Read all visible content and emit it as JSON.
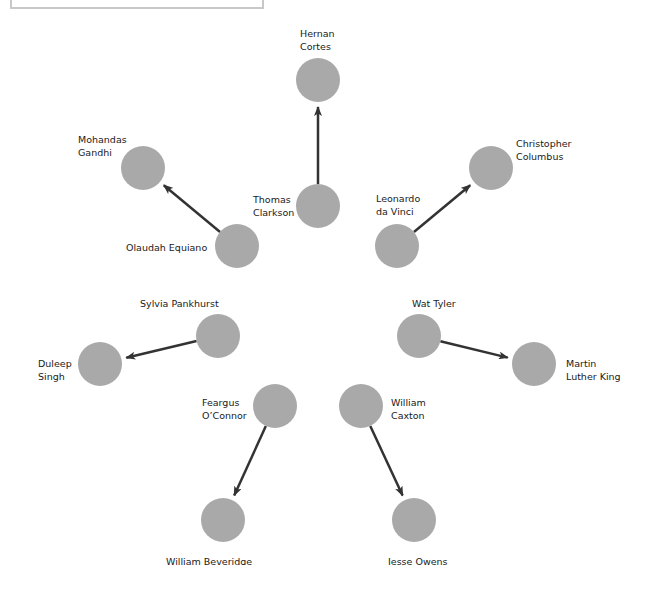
{
  "diagram": {
    "node_color": "#a9a9a9",
    "arrow_color": "#333333",
    "nodes": [
      {
        "id": "cortes",
        "label": "Hernan\nCortes",
        "cx": 318,
        "cy": 80,
        "lx": 300,
        "ly": 27
      },
      {
        "id": "clarkson",
        "label": "Thomas\nClarkson",
        "cx": 318,
        "cy": 206,
        "lx": 253,
        "ly": 193
      },
      {
        "id": "gandhi",
        "label": "Mohandas\nGandhi",
        "cx": 143,
        "cy": 168,
        "lx": 78,
        "ly": 133
      },
      {
        "id": "equiano",
        "label": "Olaudah Equiano",
        "cx": 237,
        "cy": 246,
        "lx": 126,
        "ly": 241
      },
      {
        "id": "columbus",
        "label": "Christopher\nColumbus",
        "cx": 491,
        "cy": 168,
        "lx": 516,
        "ly": 137
      },
      {
        "id": "davinci",
        "label": "Leonardo\nda Vinci",
        "cx": 397,
        "cy": 246,
        "lx": 376,
        "ly": 192
      },
      {
        "id": "pankhurst",
        "label": "Sylvia Pankhurst",
        "cx": 218,
        "cy": 336,
        "lx": 140,
        "ly": 297
      },
      {
        "id": "singh",
        "label": "Duleep\nSingh",
        "cx": 100,
        "cy": 364,
        "lx": 38,
        "ly": 357
      },
      {
        "id": "tyler",
        "label": "Wat Tyler",
        "cx": 419,
        "cy": 336,
        "lx": 412,
        "ly": 297
      },
      {
        "id": "king",
        "label": "Martin\nLuther King",
        "cx": 534,
        "cy": 364,
        "lx": 566,
        "ly": 357
      },
      {
        "id": "oconnor",
        "label": "Feargus\nO’Connor",
        "cx": 275,
        "cy": 406,
        "lx": 202,
        "ly": 396
      },
      {
        "id": "caxton",
        "label": "William\nCaxton",
        "cx": 361,
        "cy": 406,
        "lx": 391,
        "ly": 396
      },
      {
        "id": "beveridge",
        "label": "William Beveridge",
        "cx": 223,
        "cy": 520,
        "lx": 166,
        "ly": 555
      },
      {
        "id": "owens",
        "label": "Jesse Owens",
        "cx": 414,
        "cy": 520,
        "lx": 388,
        "ly": 555
      }
    ],
    "edges": [
      {
        "from": "clarkson",
        "to": "cortes"
      },
      {
        "from": "equiano",
        "to": "gandhi"
      },
      {
        "from": "davinci",
        "to": "columbus"
      },
      {
        "from": "pankhurst",
        "to": "singh"
      },
      {
        "from": "tyler",
        "to": "king"
      },
      {
        "from": "oconnor",
        "to": "beveridge"
      },
      {
        "from": "caxton",
        "to": "owens"
      }
    ]
  }
}
